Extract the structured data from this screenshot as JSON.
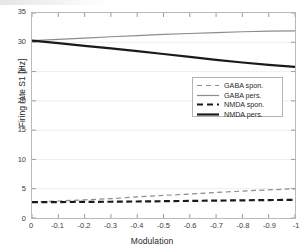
{
  "chart_data": {
    "type": "line",
    "title": "",
    "xlabel": "Modulation",
    "ylabel": "Firing rate S1 [Hz]",
    "xlim": [
      0,
      -1
    ],
    "ylim": [
      0,
      35
    ],
    "xticks": [
      0,
      -0.1,
      -0.2,
      -0.3,
      -0.4,
      -0.5,
      -0.6,
      -0.7,
      -0.8,
      -0.9,
      -1
    ],
    "xticklabels": [
      "0",
      "-0.1",
      "-0.2",
      "-0.3",
      "-0.4",
      "-0.5",
      "-0.6",
      "-0.7",
      "-0.8",
      "-0.9",
      "-1"
    ],
    "yticks": [
      0,
      5,
      10,
      15,
      20,
      25,
      30,
      35
    ],
    "yticklabels": [
      "0",
      "5",
      "10",
      "15",
      "20",
      "25",
      "30",
      "35"
    ],
    "grid": "horizontal-faint",
    "legend_position": "center-right",
    "x": [
      0,
      -0.1,
      -0.2,
      -0.3,
      -0.4,
      -0.5,
      -0.6,
      -0.7,
      -0.8,
      -0.9,
      -1
    ],
    "series": [
      {
        "name": "GABA spon.",
        "color": "#8c8c8c",
        "style": "dashed",
        "width": 1.2,
        "values": [
          2.7,
          2.9,
          3.1,
          3.3,
          3.6,
          3.85,
          4.1,
          4.35,
          4.6,
          4.8,
          5.0
        ]
      },
      {
        "name": "GABA pers.",
        "color": "#8c8c8c",
        "style": "solid",
        "width": 1.2,
        "values": [
          30.3,
          30.5,
          30.7,
          30.95,
          31.15,
          31.35,
          31.5,
          31.65,
          31.8,
          31.9,
          31.95
        ]
      },
      {
        "name": "NMDA spon.",
        "color": "#1a1a1a",
        "style": "dashed",
        "width": 2.2,
        "values": [
          2.7,
          2.72,
          2.75,
          2.78,
          2.82,
          2.87,
          2.92,
          2.97,
          3.02,
          3.06,
          3.1
        ]
      },
      {
        "name": "NMDA pers.",
        "color": "#1a1a1a",
        "style": "solid",
        "width": 2.2,
        "values": [
          30.3,
          29.85,
          29.4,
          28.95,
          28.5,
          28.0,
          27.5,
          27.0,
          26.55,
          26.15,
          25.8
        ]
      }
    ]
  },
  "legend": {
    "entries": [
      {
        "label": "GABA spon."
      },
      {
        "label": "GABA pers."
      },
      {
        "label": "NMDA spon."
      },
      {
        "label": "NMDA pers."
      }
    ]
  },
  "axes": {
    "x_title": "Modulation",
    "y_title": "Firing rate S1 [Hz]"
  }
}
